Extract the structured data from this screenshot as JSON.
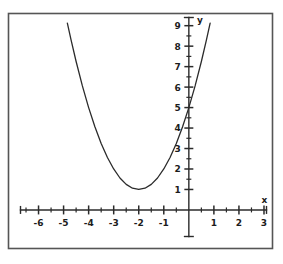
{
  "figure": {
    "name": "parabola-graph",
    "background_color": "#ffffff",
    "ink_color": "#2b2b2b",
    "frame": {
      "visible": true,
      "color": "#555555"
    }
  },
  "chart_data": {
    "type": "line",
    "title": "",
    "subtitle": "",
    "xlabel": "x",
    "ylabel": "y",
    "xlim": [
      -6.8,
      3.1
    ],
    "ylim": [
      -1.2,
      9.4
    ],
    "grid": false,
    "legend": null,
    "axis_style": "cartesian-crosshair",
    "x_ticks_major": [
      -6,
      -5,
      -4,
      -3,
      -2,
      -1,
      1,
      2,
      3
    ],
    "x_tick_labels": [
      "-6",
      "-5",
      "-4",
      "-3",
      "-2",
      "-1",
      "1",
      "2",
      "3"
    ],
    "x_ticks_minor": [
      -6.5,
      -5.5,
      -4.5,
      -3.5,
      -2.5,
      -1.5,
      -0.5,
      0.5,
      1.5,
      2.5
    ],
    "y_ticks_major": [
      1,
      2,
      3,
      4,
      5,
      6,
      7,
      8,
      9
    ],
    "y_tick_labels": [
      "1",
      "2",
      "3",
      "4",
      "5",
      "6",
      "7",
      "8",
      "9"
    ],
    "y_ticks_minor": [
      1.5,
      2.5,
      3.5,
      4.5,
      5.5,
      6.5,
      7.5,
      8.5
    ],
    "series": [
      {
        "name": "parabola",
        "equation": "y = (x + 2)^2 + 1",
        "vertex": [
          -2,
          1
        ],
        "y_intercept": [
          0,
          5
        ],
        "color": "#2b2b2b",
        "points": [
          [
            -4.85,
            9.12
          ],
          [
            -4.7,
            8.29
          ],
          [
            -4.5,
            7.25
          ],
          [
            -4.25,
            6.06
          ],
          [
            -4.0,
            5.0
          ],
          [
            -3.75,
            4.06
          ],
          [
            -3.5,
            3.25
          ],
          [
            -3.25,
            2.56
          ],
          [
            -3.0,
            2.0
          ],
          [
            -2.75,
            1.56
          ],
          [
            -2.5,
            1.25
          ],
          [
            -2.25,
            1.06
          ],
          [
            -2.0,
            1.0
          ],
          [
            -1.75,
            1.06
          ],
          [
            -1.5,
            1.25
          ],
          [
            -1.25,
            1.56
          ],
          [
            -1.0,
            2.0
          ],
          [
            -0.75,
            2.56
          ],
          [
            -0.5,
            3.25
          ],
          [
            -0.25,
            4.06
          ],
          [
            0.0,
            5.0
          ],
          [
            0.25,
            6.06
          ],
          [
            0.5,
            7.25
          ],
          [
            0.7,
            8.29
          ],
          [
            0.85,
            9.12
          ]
        ]
      }
    ]
  }
}
